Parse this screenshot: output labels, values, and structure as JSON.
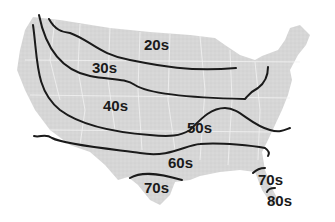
{
  "map": {
    "type": "isotherm-map",
    "region": "Contiguous United States",
    "land_color": "#d9d9d9",
    "line_color": "#1a1a1a",
    "background": "#ffffff",
    "labels": [
      {
        "id": "band-20s",
        "text": "20s",
        "x": 155,
        "y": 50
      },
      {
        "id": "band-30s",
        "text": "30s",
        "x": 92,
        "y": 73
      },
      {
        "id": "band-40s",
        "text": "40s",
        "x": 103,
        "y": 111
      },
      {
        "id": "band-50s",
        "text": "50s",
        "x": 187,
        "y": 133
      },
      {
        "id": "band-60s",
        "text": "60s",
        "x": 168,
        "y": 168
      },
      {
        "id": "band-70s-west",
        "text": "70s",
        "x": 144,
        "y": 193
      },
      {
        "id": "band-70s-florida",
        "text": "70s",
        "x": 258,
        "y": 185
      },
      {
        "id": "band-80s",
        "text": "80s",
        "x": 267,
        "y": 206
      }
    ]
  }
}
